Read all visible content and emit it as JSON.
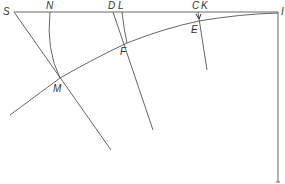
{
  "diagram": {
    "type": "geometric-construction",
    "points": {
      "S": {
        "label": "S",
        "x": 14,
        "y": 12
      },
      "N": {
        "label": "N",
        "x": 50,
        "y": 12
      },
      "D": {
        "label": "D",
        "x": 113,
        "y": 12
      },
      "L": {
        "label": "L",
        "x": 122,
        "y": 12
      },
      "C": {
        "label": "C",
        "x": 197,
        "y": 12
      },
      "K": {
        "label": "K",
        "x": 205,
        "y": 12
      },
      "I": {
        "label": "I",
        "x": 278,
        "y": 12
      },
      "M": {
        "label": "M",
        "x": 60,
        "y": 78
      },
      "F": {
        "label": "F",
        "x": 127,
        "y": 43
      },
      "E": {
        "label": "E",
        "x": 199,
        "y": 22
      }
    },
    "labels": [
      "S",
      "N",
      "D",
      "L",
      "C",
      "K",
      "I",
      "M",
      "F",
      "E"
    ]
  }
}
